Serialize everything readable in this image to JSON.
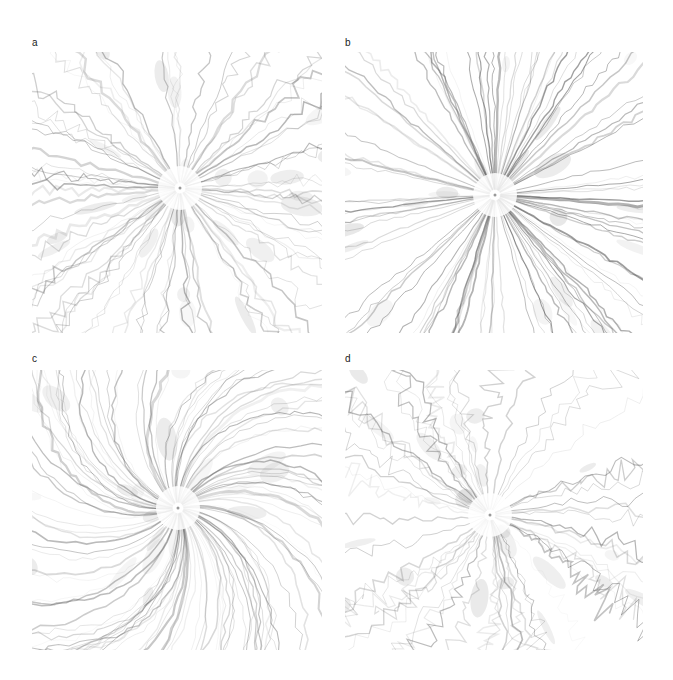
{
  "figure": {
    "background": "#ffffff",
    "panels": [
      {
        "label": "a",
        "label_pos": [
          32,
          38
        ],
        "box": [
          32,
          52,
          290,
          281
        ],
        "center": [
          148,
          136
        ],
        "style": "turbulent",
        "rays": 90,
        "swirl": 0.0,
        "wiggle": 9,
        "ink": "#555555"
      },
      {
        "label": "b",
        "label_pos": [
          345,
          38
        ],
        "box": [
          345,
          52,
          298,
          281
        ],
        "center": [
          150,
          143
        ],
        "style": "straight",
        "rays": 110,
        "swirl": 0.0,
        "wiggle": 3,
        "ink": "#444444"
      },
      {
        "label": "c",
        "label_pos": [
          32,
          354
        ],
        "box": [
          32,
          370,
          290,
          280
        ],
        "center": [
          146,
          138
        ],
        "style": "spiral",
        "rays": 120,
        "swirl": 0.9,
        "wiggle": 4,
        "ink": "#555555"
      },
      {
        "label": "d",
        "label_pos": [
          345,
          354
        ],
        "box": [
          345,
          370,
          298,
          280
        ],
        "center": [
          145,
          145
        ],
        "style": "sparse-fractal",
        "rays": 60,
        "swirl": 0.15,
        "wiggle": 12,
        "ink": "#505050"
      }
    ]
  }
}
